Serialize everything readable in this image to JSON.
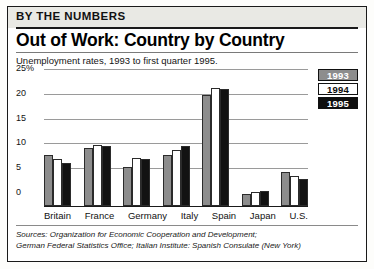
{
  "header": {
    "kicker": "BY THE NUMBERS",
    "headline": "Out of Work: Country by Country",
    "subtitle": "Unemployment rates, 1993 to first quarter 1995."
  },
  "legend": {
    "position": "top-right",
    "items": [
      {
        "label": "1993",
        "swatch": "#8d8d8d",
        "text_color": "#ffffff"
      },
      {
        "label": "1994",
        "swatch": "#ffffff",
        "text_color": "#0b0b0b"
      },
      {
        "label": "1995",
        "swatch": "#0f0f0f",
        "text_color": "#ffffff"
      }
    ]
  },
  "sources": {
    "line1": "Sources: Organization for Economic Cooperation and Development;",
    "line2": "German Federal Statistics Office; Italian Institute: Spanish Consulate (New York)"
  },
  "chart_data": {
    "type": "bar",
    "title": "Out of Work: Country by Country",
    "subtitle": "Unemployment rates, 1993 to first quarter 1995.",
    "xlabel": "",
    "ylabel": "",
    "ylim": [
      0,
      25
    ],
    "yticks": [
      "25%",
      "20",
      "15",
      "10",
      "5",
      "0"
    ],
    "ytick_values": [
      25,
      20,
      15,
      10,
      5,
      0
    ],
    "grid": true,
    "grid_axis": "y",
    "legend_position": "top-right",
    "categories": [
      "Britain",
      "France",
      "Germany",
      "Italy",
      "Spain",
      "Japan",
      "U.S."
    ],
    "series": [
      {
        "name": "1993",
        "color": "#8d8d8d",
        "values": [
          10.3,
          11.7,
          7.9,
          10.2,
          22.4,
          2.5,
          6.8
        ]
      },
      {
        "name": "1994",
        "color": "#ffffff",
        "values": [
          9.4,
          12.3,
          9.6,
          11.3,
          23.8,
          2.9,
          6.1
        ]
      },
      {
        "name": "1995",
        "color": "#121212",
        "values": [
          8.7,
          12.2,
          9.4,
          12.0,
          23.5,
          3.0,
          5.5
        ]
      }
    ]
  }
}
